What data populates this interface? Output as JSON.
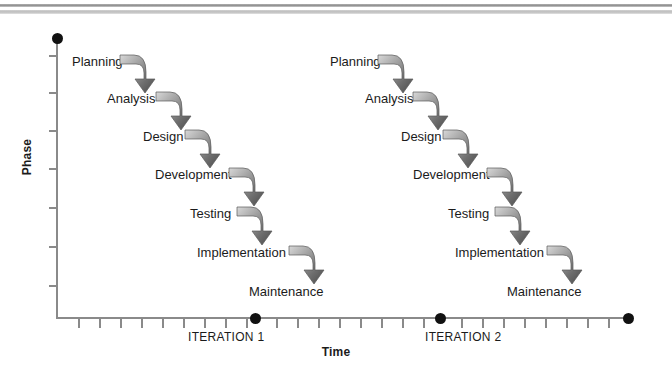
{
  "diagram": {
    "axes": {
      "x_title": "Time",
      "y_title": "Phase"
    },
    "iterations": [
      {
        "label": "ITERATION 1",
        "label_x": 188,
        "marker_x": 255,
        "phases": [
          {
            "name": "Planning",
            "x": 72,
            "y": 55,
            "hook_x": 119,
            "hook_y": 53
          },
          {
            "name": "Analysis",
            "x": 107,
            "y": 92,
            "hook_x": 155,
            "hook_y": 90
          },
          {
            "name": "Design",
            "x": 143,
            "y": 130,
            "hook_x": 184,
            "hook_y": 128
          },
          {
            "name": "Development",
            "x": 155,
            "y": 168,
            "hook_x": 228,
            "hook_y": 166
          },
          {
            "name": "Testing",
            "x": 190,
            "y": 207,
            "hook_x": 236,
            "hook_y": 205
          },
          {
            "name": "Implementation",
            "x": 197,
            "y": 246,
            "hook_x": 288,
            "hook_y": 244
          },
          {
            "name": "Maintenance",
            "x": 249,
            "y": 285,
            "hook_x": null,
            "hook_y": null
          }
        ]
      },
      {
        "label": "ITERATION 2",
        "label_x": 425,
        "marker_x": 440,
        "phases": [
          {
            "name": "Planning",
            "x": 330,
            "y": 55,
            "hook_x": 377,
            "hook_y": 53
          },
          {
            "name": "Analysis",
            "x": 365,
            "y": 92,
            "hook_x": 412,
            "hook_y": 90
          },
          {
            "name": "Design",
            "x": 401,
            "y": 130,
            "hook_x": 442,
            "hook_y": 128
          },
          {
            "name": "Development",
            "x": 413,
            "y": 168,
            "hook_x": 486,
            "hook_y": 166
          },
          {
            "name": "Testing",
            "x": 448,
            "y": 207,
            "hook_x": 494,
            "hook_y": 205
          },
          {
            "name": "Implementation",
            "x": 455,
            "y": 246,
            "hook_x": 546,
            "hook_y": 244
          },
          {
            "name": "Maintenance",
            "x": 507,
            "y": 285,
            "hook_x": null,
            "hook_y": null
          }
        ]
      }
    ],
    "x_axis_markers": [
      255,
      440,
      628
    ],
    "x_ticks": [
      78,
      99,
      120,
      141,
      162,
      183,
      204,
      225,
      246,
      276,
      297,
      318,
      339,
      360,
      381,
      402,
      423,
      461,
      482,
      503,
      524,
      545,
      566,
      587,
      608
    ],
    "y_ticks": [
      55,
      92,
      130,
      168,
      207,
      246,
      285
    ],
    "colors": {
      "axis": "#8a8a8a",
      "text": "#1b1b1b",
      "marker": "#111111",
      "arrow_light": "#d8d8d8",
      "arrow_dark": "#4a4a4a",
      "rule": "#b4b4b4"
    }
  },
  "chart_data": {
    "type": "line",
    "xlabel": "Time",
    "ylabel": "Phase",
    "categories": [
      "Planning",
      "Analysis",
      "Design",
      "Development",
      "Testing",
      "Implementation",
      "Maintenance"
    ],
    "series": [
      {
        "name": "ITERATION 1",
        "values": [
          1,
          2,
          3,
          4,
          5,
          6,
          7
        ]
      },
      {
        "name": "ITERATION 2",
        "values": [
          1,
          2,
          3,
          4,
          5,
          6,
          7
        ]
      }
    ],
    "grid": false,
    "legend": "none"
  }
}
